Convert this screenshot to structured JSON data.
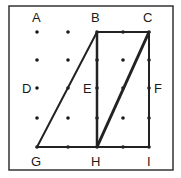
{
  "diagram": {
    "type": "geoboard-grid",
    "frame": {
      "x": 9,
      "y": 6,
      "width": 164,
      "height": 164,
      "stroke": "#333333"
    },
    "grid": {
      "columns_x": [
        37,
        68,
        97,
        123,
        149
      ],
      "rows_y": [
        32,
        60,
        88,
        118,
        147
      ],
      "dot_color": "#1a1a1a",
      "dot_radius": 1.8
    },
    "points": [
      {
        "label": "A",
        "x": 37,
        "y": 32,
        "label_x": 32,
        "label_y": 22
      },
      {
        "label": "B",
        "x": 97,
        "y": 32,
        "label_x": 91,
        "label_y": 22
      },
      {
        "label": "C",
        "x": 149,
        "y": 32,
        "label_x": 143,
        "label_y": 22
      },
      {
        "label": "D",
        "x": 37,
        "y": 88,
        "label_x": 22,
        "label_y": 93
      },
      {
        "label": "E",
        "x": 97,
        "y": 88,
        "label_x": 83,
        "label_y": 93
      },
      {
        "label": "F",
        "x": 149,
        "y": 88,
        "label_x": 154,
        "label_y": 93
      },
      {
        "label": "G",
        "x": 37,
        "y": 147,
        "label_x": 31,
        "label_y": 166
      },
      {
        "label": "H",
        "x": 97,
        "y": 147,
        "label_x": 91,
        "label_y": 166
      },
      {
        "label": "I",
        "x": 149,
        "y": 147,
        "label_x": 147,
        "label_y": 166
      }
    ],
    "shapes": [
      {
        "name": "triangle-BGH",
        "vertices": [
          "B",
          "G",
          "H"
        ],
        "stroke": "#222222",
        "stroke_width": 2
      },
      {
        "name": "rectangle-BCIH",
        "vertices": [
          "B",
          "C",
          "I",
          "H"
        ],
        "stroke": "#222222",
        "stroke_width": 2
      },
      {
        "name": "diagonal-CH",
        "vertices": [
          "C",
          "H"
        ],
        "stroke": "#222222",
        "stroke_width": 3
      }
    ]
  }
}
